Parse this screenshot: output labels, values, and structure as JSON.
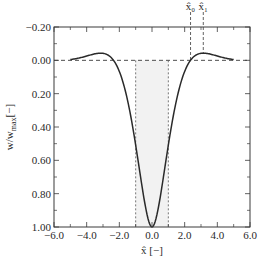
{
  "chart_data": {
    "type": "line",
    "title": "",
    "xlabel": "x̂ [−]",
    "ylabel": "w/w",
    "ylabel_subscript": "max",
    "ylabel_suffix": "[−]",
    "xlim": [
      -6.0,
      6.0
    ],
    "ylim": [
      -0.2,
      1.0
    ],
    "y_inverted": true,
    "grid": false,
    "xticks": [
      -6.0,
      -4.0,
      -2.0,
      0.0,
      2.0,
      4.0,
      6.0
    ],
    "xtick_labels": [
      "−6.0",
      "−4.0",
      "−2.0",
      "0.0",
      "2.0",
      "4.0",
      "6.0"
    ],
    "yticks": [
      -0.2,
      0.0,
      0.2,
      0.4,
      0.6,
      0.8,
      1.0
    ],
    "ytick_labels": [
      "−0.20",
      "0.00",
      "0.20",
      "0.40",
      "0.60",
      "0.80",
      "1.00"
    ],
    "series": [
      {
        "name": "deflection",
        "function": "exp(-|x|)*(cos|x| + sin|x|)",
        "x_range": [
          -5.0,
          5.0
        ],
        "x": [
          -5.0,
          -4.5,
          -4.0,
          -3.5,
          -3.14,
          -3.0,
          -2.5,
          -2.36,
          -2.0,
          -1.5,
          -1.0,
          -0.5,
          0.0,
          0.5,
          1.0,
          1.5,
          2.0,
          2.36,
          2.5,
          3.0,
          3.14,
          3.5,
          4.0,
          4.5,
          5.0
        ],
        "y": [
          -0.0042,
          -0.0238,
          -0.0245,
          -0.0386,
          -0.0432,
          -0.0423,
          -0.0139,
          0.0,
          0.0667,
          0.2384,
          0.5083,
          0.8231,
          1.0,
          0.8231,
          0.5083,
          0.2384,
          0.0667,
          0.0,
          -0.0139,
          -0.0423,
          -0.0432,
          -0.0386,
          -0.0245,
          -0.0238,
          -0.0042
        ]
      }
    ],
    "reference_lines": {
      "horizontal_dashed_y": 0.0,
      "vertical_dotted_x": [
        -1.0,
        1.0
      ],
      "shaded_region_x": [
        -1.0,
        1.0
      ]
    },
    "annotations": [
      {
        "label": "x̂₀",
        "x": 2.36
      },
      {
        "label": "x̂₁",
        "x": 3.14
      }
    ]
  },
  "colors": {
    "curve": "#2a2a2a",
    "axis": "#3a3a3a",
    "shade": "#f2f2f2"
  }
}
